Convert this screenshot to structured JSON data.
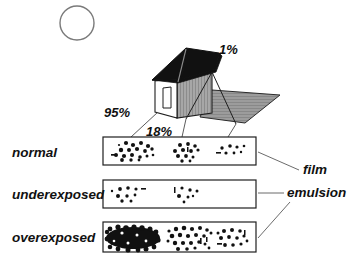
{
  "figure": {
    "type": "diagram",
    "background_color": "#ffffff",
    "ink_color": "#111111"
  },
  "scene": {
    "sun": {
      "name": "sun",
      "shape": "circle",
      "cx": 77,
      "cy": 23,
      "r": 17,
      "fill": "none",
      "stroke": "#6f6f6f"
    },
    "house": {
      "roof_color": "#121212",
      "front_wall_color": "#ffffff",
      "side_wall_color": "#9a9a9a",
      "shadow_color": "#8f8f8f",
      "door": {
        "name": "door",
        "present": true
      }
    }
  },
  "reflectance_labels": [
    {
      "id": "sky",
      "text": "1%",
      "x": 219,
      "y": 43
    },
    {
      "id": "wall-lit",
      "text": "95%",
      "x": 104,
      "y": 106
    },
    {
      "id": "wall-shadow",
      "text": "18%",
      "x": 146,
      "y": 125
    }
  ],
  "strips": [
    {
      "id": "normal",
      "label": "normal",
      "label_x": 10,
      "label_y": 152,
      "box": {
        "x": 103,
        "y": 137,
        "w": 153,
        "h": 28
      },
      "clusters": [
        {
          "id": "highlight",
          "density": "high",
          "count": 19
        },
        {
          "id": "midtone",
          "density": "medium",
          "count": 13
        },
        {
          "id": "shadow",
          "density": "low",
          "count": 7
        }
      ]
    },
    {
      "id": "underexposed",
      "label": "underexposed",
      "label_x": 10,
      "label_y": 194,
      "box": {
        "x": 103,
        "y": 180,
        "w": 153,
        "h": 28
      },
      "clusters": [
        {
          "id": "highlight",
          "density": "low",
          "count": 9
        },
        {
          "id": "midtone",
          "density": "very-low",
          "count": 7
        },
        {
          "id": "shadow",
          "density": "none",
          "count": 0
        }
      ]
    },
    {
      "id": "overexposed",
      "label": "overexposed",
      "label_x": 10,
      "label_y": 238,
      "box": {
        "x": 103,
        "y": 222,
        "w": 153,
        "h": 30
      },
      "clusters": [
        {
          "id": "highlight",
          "density": "saturated",
          "count": 46
        },
        {
          "id": "midtone",
          "density": "high",
          "count": 24
        },
        {
          "id": "shadow",
          "density": "medium",
          "count": 14
        }
      ]
    }
  ],
  "callouts": [
    {
      "id": "film",
      "text": "film",
      "x": 305,
      "y": 165
    },
    {
      "id": "emulsion",
      "text": "emulsion",
      "x": 288,
      "y": 188
    }
  ]
}
